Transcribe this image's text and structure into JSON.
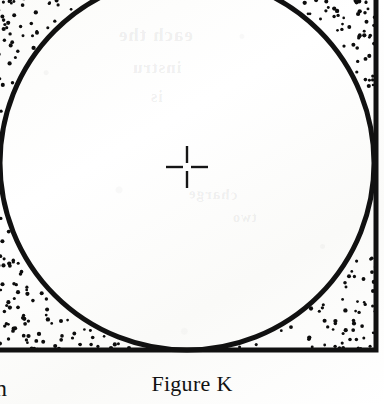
{
  "page": {
    "kind": "scanned-textbook-figure",
    "width": 384,
    "height": 404,
    "paper_color": "#fdfdfc",
    "ink_color": "#111111"
  },
  "figure": {
    "caption": "Figure K",
    "square": {
      "label": "square-outline",
      "stroke_color": "#111111",
      "stroke_width": 5,
      "right_edge_x": 376,
      "bottom_edge_y": 350,
      "top_edge_y": -36,
      "left_edge_x": -40,
      "note": "left and top edges extend past the cropped page edge"
    },
    "circle": {
      "label": "inscribed-circle",
      "stroke_color": "#111111",
      "stroke_width": 5,
      "center_x": 187,
      "center_y": 163,
      "radius": 187,
      "note": "tangent to square on all four sides; top of circle cropped by page edge"
    },
    "crosshair": {
      "label": "center-mark",
      "center_x": 187,
      "center_y": 167,
      "arm_length": 21,
      "gap": 4,
      "stroke_color": "#151515",
      "stroke_width": 2.4
    },
    "stipple": {
      "label": "corner-shading",
      "dot_color": "#0d0d0d",
      "dot_radius": 1.7,
      "regions": [
        "top-left",
        "top-right",
        "bottom-left",
        "bottom-right"
      ],
      "note": "random dot fill between the circle and the square corners"
    }
  },
  "bleed_through": {
    "note": "faint mirrored text showing through from the reverse side of the page",
    "lines": [
      "each the",
      "instru",
      "is",
      "charge",
      "two"
    ]
  },
  "edge_fragment": {
    "text": "n",
    "note": "partial word from the adjacent column, clipped by the left page edge"
  }
}
